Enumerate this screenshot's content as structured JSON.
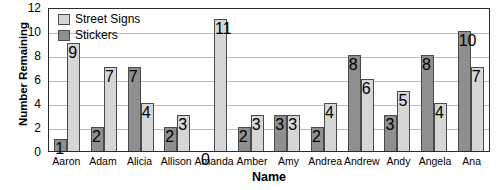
{
  "chart_data": {
    "type": "bar",
    "title": "",
    "xlabel": "Name",
    "ylabel": "Number Remaining",
    "ylim": [
      0,
      12
    ],
    "yticks": [
      0,
      2,
      4,
      6,
      8,
      10,
      12
    ],
    "grid": true,
    "legend_position": "top-left",
    "categories": [
      "Aaron",
      "Adam",
      "Alicia",
      "Allison",
      "Amanda",
      "Amber",
      "Amy",
      "Andrea",
      "Andrew",
      "Andy",
      "Angela",
      "Ana"
    ],
    "series": [
      {
        "name": "Stickers",
        "color": "#8f8f8f",
        "values": [
          1,
          2,
          7,
          2,
          0,
          2,
          3,
          2,
          8,
          3,
          8,
          10
        ]
      },
      {
        "name": "Street Signs",
        "color": "#d6d6d6",
        "values": [
          9,
          7,
          4,
          3,
          11,
          3,
          3,
          4,
          6,
          5,
          4,
          7
        ]
      }
    ]
  },
  "legend": {
    "entries": [
      {
        "label": "Street Signs",
        "swatch": "series-signs"
      },
      {
        "label": "Stickers",
        "swatch": "series-stickers"
      }
    ]
  }
}
